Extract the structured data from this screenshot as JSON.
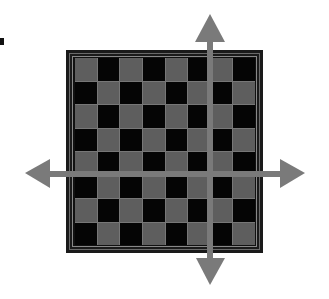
{
  "diagram": {
    "title": "",
    "bullet": "■",
    "board": {
      "rows": 8,
      "cols": 8,
      "pattern": [
        [
          "light",
          "dark",
          "light",
          "dark",
          "light",
          "dark",
          "light",
          "dark"
        ],
        [
          "dark",
          "light",
          "dark",
          "light",
          "dark",
          "light",
          "dark",
          "light"
        ],
        [
          "light",
          "dark",
          "light",
          "dark",
          "light",
          "dark",
          "light",
          "dark"
        ],
        [
          "dark",
          "light",
          "dark",
          "light",
          "dark",
          "light",
          "dark",
          "light"
        ],
        [
          "light",
          "dark",
          "light",
          "dark",
          "light",
          "dark",
          "light",
          "dark"
        ],
        [
          "dark",
          "light",
          "dark",
          "light",
          "dark",
          "light",
          "dark",
          "light"
        ],
        [
          "light",
          "dark",
          "light",
          "dark",
          "light",
          "dark",
          "light",
          "dark"
        ],
        [
          "dark",
          "light",
          "dark",
          "light",
          "dark",
          "light",
          "dark",
          "light"
        ]
      ],
      "colors": {
        "light": "#5e5e5e",
        "dark": "#050505",
        "frame": "#1a1a1a",
        "grid_line": "#777777"
      }
    },
    "arrows": [
      {
        "name": "arrow-up",
        "direction": "up"
      },
      {
        "name": "arrow-down",
        "direction": "down"
      },
      {
        "name": "arrow-left",
        "direction": "left"
      },
      {
        "name": "arrow-right",
        "direction": "right"
      }
    ],
    "arrow_color": "#7a7a7a"
  }
}
